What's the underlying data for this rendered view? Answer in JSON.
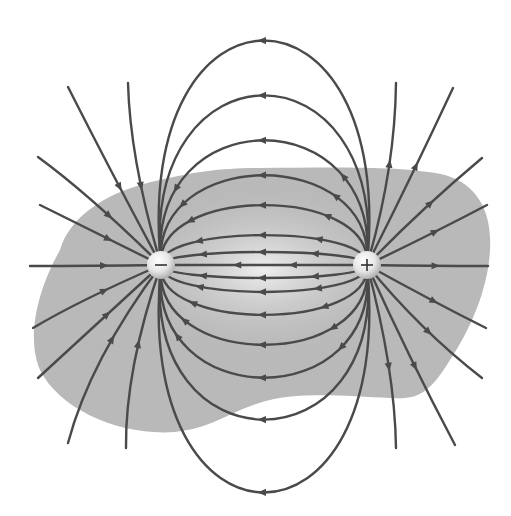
{
  "diagram": {
    "title": "Electric field lines of an electric dipole",
    "background_color": "#ffffff",
    "region_color": "#b9b9b9",
    "line_color": "#4a4a4a",
    "charges": [
      {
        "name": "negative-charge",
        "sign": "−",
        "x": 161,
        "y": 265,
        "r": 14
      },
      {
        "name": "positive-charge",
        "sign": "+",
        "x": 367,
        "y": 265,
        "r": 14
      }
    ],
    "field_direction": "from positive charge (+) to negative charge (−)",
    "closed_loop_count_above": 7,
    "closed_loop_count_below": 7,
    "open_line_count_per_charge": 10
  }
}
